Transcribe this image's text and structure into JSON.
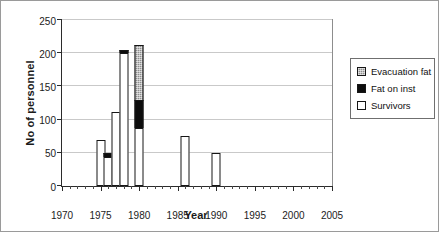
{
  "chart_data": {
    "type": "bar",
    "subtype": "stacked-vertical",
    "title": "",
    "xlabel": "Year",
    "ylabel": "No of personnel",
    "xlim": [
      1970,
      2005
    ],
    "ylim": [
      0,
      250
    ],
    "ytick_step": 50,
    "xtick_step": 5,
    "xminor_step": 1,
    "grid": "horizontal",
    "legend_position": "right-outside",
    "x": [
      1975,
      1976,
      1977,
      1978,
      1980,
      1986,
      1990
    ],
    "xtick_labels": [
      "1970",
      "1975",
      "1980",
      "1985",
      "1990",
      "1995",
      "2000",
      "2005"
    ],
    "ytick_labels": [
      "0",
      "50",
      "100",
      "150",
      "200",
      "250"
    ],
    "series": [
      {
        "name": "Survivors",
        "color": "#ffffff",
        "values": [
          70,
          43,
          112,
          200,
          88,
          76,
          49
        ]
      },
      {
        "name": "Fat on inst",
        "color": "#0d0d0d",
        "values": [
          0,
          7,
          0,
          5,
          42,
          0,
          0
        ]
      },
      {
        "name": "Evacuation fat",
        "color": "#8e8e8e",
        "values": [
          0,
          0,
          0,
          0,
          82,
          0,
          0
        ]
      }
    ],
    "totals": [
      70,
      50,
      112,
      205,
      212,
      76,
      49
    ],
    "legend": [
      {
        "label": "Evacuation fat",
        "swatch": "evac"
      },
      {
        "label": "Fat on inst",
        "swatch": "inst"
      },
      {
        "label": "Survivors",
        "swatch": "surv"
      }
    ]
  }
}
